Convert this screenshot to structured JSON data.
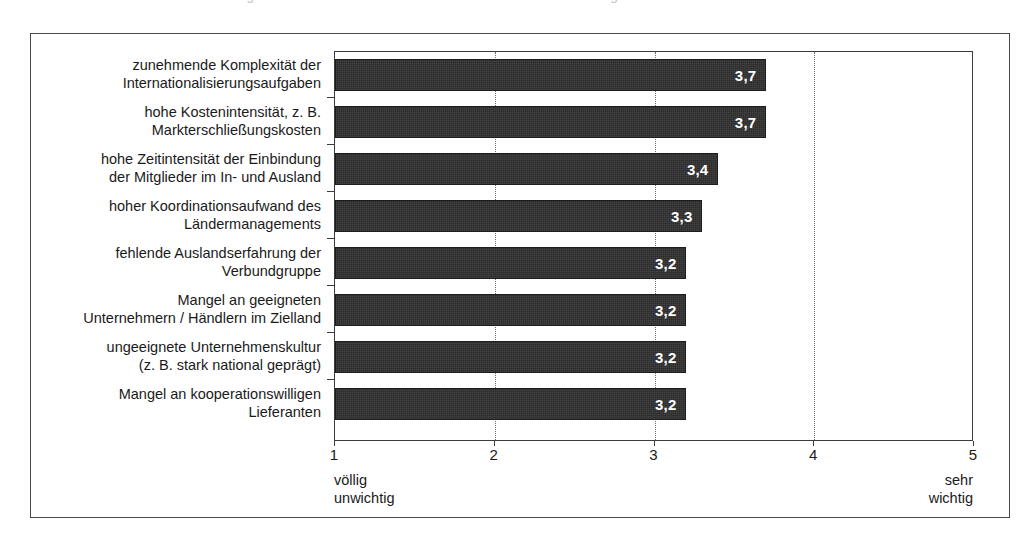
{
  "figure": {
    "scan_remnant": "Abbildung",
    "background_color": "#ffffff",
    "frame_color": "#4a4a4a",
    "bar_color": "#2b2b2b",
    "value_label_color": "#ffffff"
  },
  "chart_data": {
    "type": "bar",
    "orientation": "horizontal",
    "title": "",
    "subtitle": "",
    "xlabel": "",
    "ylabel": "",
    "xlim": [
      1,
      5
    ],
    "grid": true,
    "grid_axis": "x",
    "grid_style": "dotted",
    "legend": null,
    "categories": [
      "zunehmende Komplexität der\nInternationalisierungsaufgaben",
      "hohe Kostenintensität, z. B.\nMarkterschließungskosten",
      "hohe Zeitintensität der Einbindung\nder Mitglieder im In- und Ausland",
      "hoher Koordinationsaufwand des\nLändermanagements",
      "fehlende Auslandserfahrung der\nVerbundgruppe",
      "Mangel an geeigneten\nUnternehmern / Händlern im Zielland",
      "ungeeignete Unternehmenskultur\n(z. B. stark national geprägt)",
      "Mangel an kooperationswilligen\nLieferanten"
    ],
    "values": [
      3.7,
      3.7,
      3.4,
      3.3,
      3.2,
      3.2,
      3.2,
      3.2
    ],
    "value_labels": [
      "3,7",
      "3,7",
      "3,4",
      "3,3",
      "3,2",
      "3,2",
      "3,2",
      "3,2"
    ],
    "xticks": [
      1,
      2,
      3,
      4,
      5
    ],
    "xtick_labels": [
      "1",
      "2",
      "3",
      "4",
      "5"
    ],
    "scale_anchor_low": "völlig\nunwichtig",
    "scale_anchor_high": "sehr\nwichtig"
  }
}
